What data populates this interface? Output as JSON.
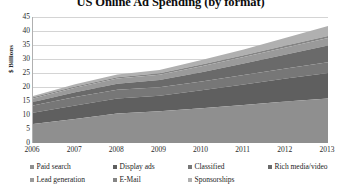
{
  "chart": {
    "title": "US Online Ad Spending (by format)",
    "ylabel": "$ Billions"
  },
  "chart_data": {
    "type": "area",
    "title": "US Online Ad Spending (by format)",
    "subtitle": "",
    "xlabel": "",
    "ylabel": "$ Billions",
    "stacked": true,
    "grid": true,
    "legend_position": "bottom",
    "x": [
      2006,
      2007,
      2008,
      2009,
      2010,
      2011,
      2012,
      2013
    ],
    "xtick_labels": [
      "2006",
      "2007",
      "2008",
      "2009",
      "2010",
      "2011",
      "2012",
      "2013"
    ],
    "xlim": [
      2006,
      2013
    ],
    "ylim": [
      0,
      45
    ],
    "ytick_labels": [
      "0",
      "5",
      "10",
      "15",
      "20",
      "25",
      "30",
      "35",
      "40",
      "45"
    ],
    "ytick_values": [
      0,
      5,
      10,
      15,
      20,
      25,
      30,
      35,
      40,
      45
    ],
    "categories": [
      "2006",
      "2007",
      "2008",
      "2009",
      "2010",
      "2011",
      "2012",
      "2013"
    ],
    "series": [
      {
        "name": "Paid search",
        "color": "#8f8f8f",
        "values": [
          6.8,
          8.6,
          10.5,
          11.3,
          12.4,
          13.6,
          14.8,
          15.9
        ]
      },
      {
        "name": "Display ads",
        "color": "#5f5f5f",
        "values": [
          4.0,
          4.8,
          5.4,
          5.6,
          6.4,
          7.3,
          8.2,
          9.1
        ]
      },
      {
        "name": "Classified",
        "color": "#777777",
        "values": [
          2.6,
          3.0,
          3.1,
          3.0,
          3.2,
          3.4,
          3.6,
          3.8
        ]
      },
      {
        "name": "Rich media/video",
        "color": "#6a6a6a",
        "values": [
          1.2,
          1.7,
          2.2,
          2.6,
          3.3,
          4.1,
          5.0,
          6.0
        ]
      },
      {
        "name": "Lead generation",
        "color": "#9a9a9a",
        "values": [
          1.3,
          1.6,
          1.8,
          1.9,
          2.1,
          2.3,
          2.5,
          2.7
        ]
      },
      {
        "name": "E-Mail",
        "color": "#858585",
        "values": [
          0.4,
          0.5,
          0.5,
          0.5,
          0.6,
          0.6,
          0.7,
          0.7
        ]
      },
      {
        "name": "Sponsorships",
        "color": "#b0b0b0",
        "values": [
          0.5,
          0.8,
          1.0,
          1.2,
          1.6,
          2.1,
          2.8,
          3.6
        ]
      }
    ],
    "totals": [
      16.8,
      21.0,
      24.5,
      26.1,
      29.6,
      33.4,
      37.6,
      41.8
    ]
  }
}
